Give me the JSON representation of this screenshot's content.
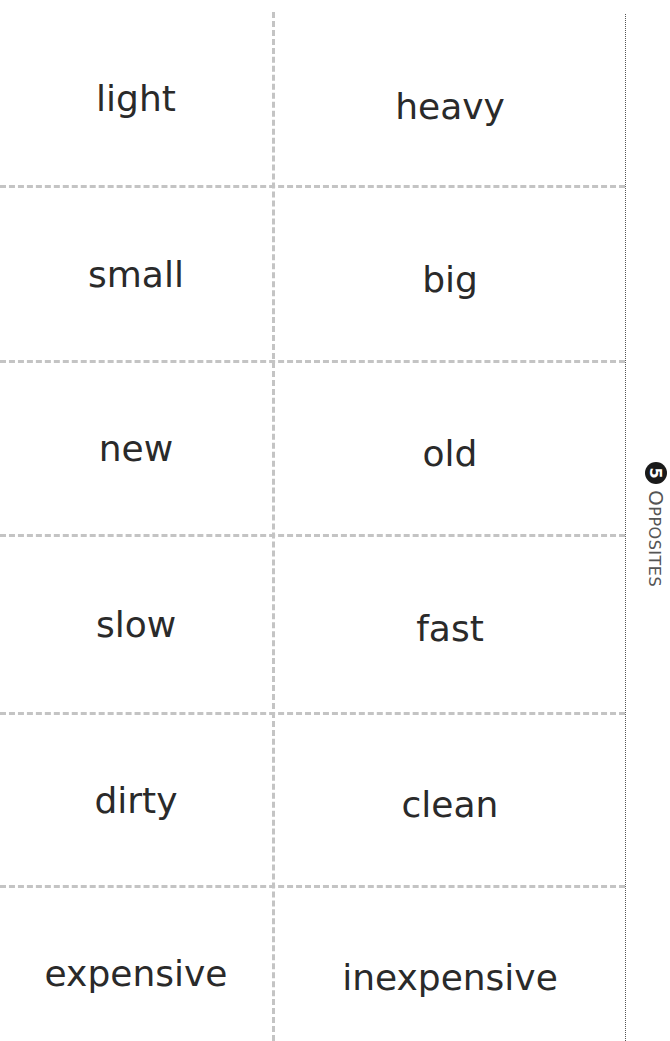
{
  "section": {
    "number": "5",
    "title_first": "O",
    "title_rest": "PPOSITES"
  },
  "cards": [
    {
      "left": "light",
      "right": "heavy"
    },
    {
      "left": "small",
      "right": "big"
    },
    {
      "left": "new",
      "right": "old"
    },
    {
      "left": "slow",
      "right": "fast"
    },
    {
      "left": "dirty",
      "right": "clean"
    },
    {
      "left": "expensive",
      "right": "inexpensive"
    }
  ],
  "colors": {
    "text": "#2a2a2a",
    "cut_line": "#c4c4c4",
    "badge": "#1a1a1a"
  }
}
